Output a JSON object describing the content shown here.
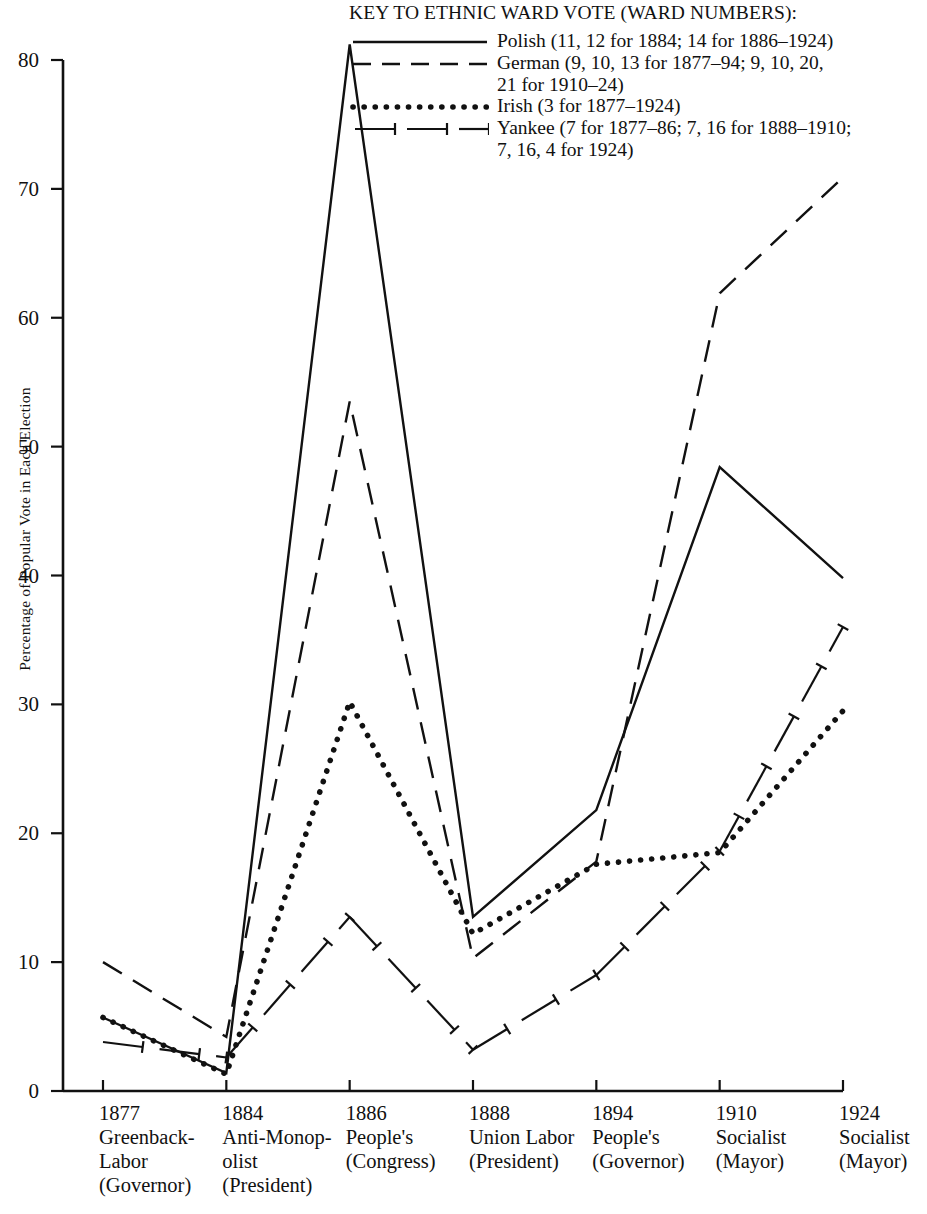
{
  "legend": {
    "title": "KEY TO ETHNIC WARD VOTE (WARD NUMBERS):",
    "entries": [
      {
        "style": "solid",
        "label": "Polish (11, 12 for 1884; 14 for 1886–1924)",
        "continuation": ""
      },
      {
        "style": "dashed",
        "label": "German (9, 10, 13 for 1877–94; 9, 10, 20,",
        "continuation": "21 for 1910–24)"
      },
      {
        "style": "dotted",
        "label": "Irish (3 for 1877–1924)",
        "continuation": ""
      },
      {
        "style": "dashdot",
        "label": "Yankee (7 for 1877–86; 7, 16 for 1888–1910;",
        "continuation": "7, 16, 4 for 1924)"
      }
    ]
  },
  "chart_data": {
    "type": "line",
    "title": "",
    "xlabel": "",
    "ylabel": "Percentage of Popular Vote in Each Election",
    "ylim": [
      0,
      80
    ],
    "yticks": [
      0,
      10,
      20,
      30,
      40,
      50,
      60,
      70,
      80
    ],
    "grid": false,
    "legend_position": "top-right",
    "categories": [
      "1877",
      "1884",
      "1886",
      "1888",
      "1894",
      "1910",
      "1924"
    ],
    "category_labels": [
      {
        "year": "1877",
        "party": "Greenback-\nLabor",
        "office": "(Governor)"
      },
      {
        "year": "1884",
        "party": "Anti-Monop-\nolist",
        "office": "(President)"
      },
      {
        "year": "1886",
        "party": "People's",
        "office": "(Congress)"
      },
      {
        "year": "1888",
        "party": "Union Labor",
        "office": "(President)"
      },
      {
        "year": "1894",
        "party": "People's",
        "office": "(Governor)"
      },
      {
        "year": "1910",
        "party": "Socialist",
        "office": "(Mayor)"
      },
      {
        "year": "1924",
        "party": "Socialist",
        "office": "(Mayor)"
      }
    ],
    "series": [
      {
        "name": "Polish",
        "style": "solid",
        "values": [
          5.7,
          1.4,
          81.2,
          13.5,
          21.8,
          48.4,
          39.8
        ]
      },
      {
        "name": "German",
        "style": "dashed",
        "values": [
          10.0,
          4.2,
          53.5,
          10.3,
          17.8,
          61.9,
          70.9
        ]
      },
      {
        "name": "Irish",
        "style": "dotted",
        "values": [
          5.7,
          1.3,
          30.2,
          12.2,
          17.6,
          18.5,
          29.5
        ]
      },
      {
        "name": "Yankee",
        "style": "dashdot",
        "values": [
          3.8,
          2.6,
          13.5,
          3.2,
          9.0,
          18.6,
          36.0
        ]
      }
    ]
  },
  "colors": {
    "ink": "#111111",
    "background": "#ffffff"
  }
}
